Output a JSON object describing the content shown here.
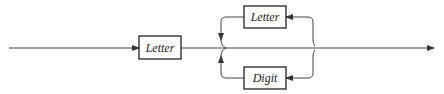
{
  "diagram": {
    "type": "syntax-diagram",
    "nodes": [
      {
        "id": "letter-first",
        "label": "Letter"
      },
      {
        "id": "letter-loop",
        "label": "Letter"
      },
      {
        "id": "digit-loop",
        "label": "Digit"
      }
    ],
    "colors": {
      "stroke": "#333333",
      "background": "#ffffff"
    }
  }
}
